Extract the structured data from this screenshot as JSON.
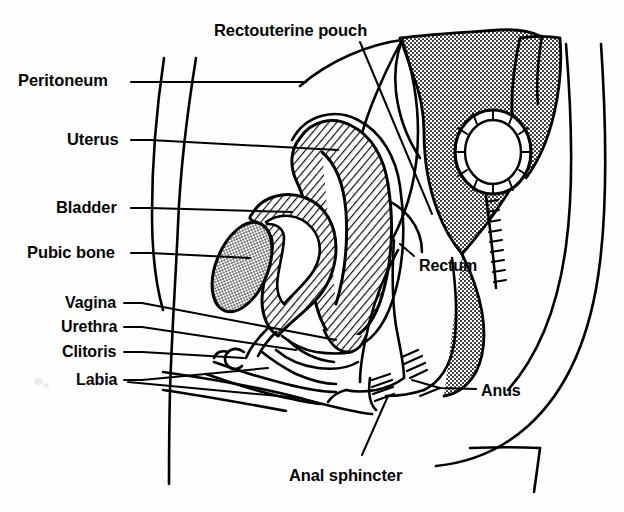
{
  "figure": {
    "title": "Rectouterine pouch",
    "kind": "anatomical-line-diagram",
    "background_color": "#fefefe",
    "ink_color": "#000000"
  },
  "labels": {
    "rectouterine_pouch": "Rectouterine pouch",
    "peritoneum": "Peritoneum",
    "uterus": "Uterus",
    "bladder": "Bladder",
    "pubic_bone": "Pubic bone",
    "vagina": "Vagina",
    "urethra": "Urethra",
    "clitoris": "Clitoris",
    "labia": "Labia",
    "rectum": "Rectum",
    "anus": "Anus",
    "anal_sphincter": "Anal sphincter"
  },
  "label_positions": {
    "rectouterine_pouch": {
      "x": 214,
      "y": 22
    },
    "peritoneum": {
      "x": 18,
      "y": 72
    },
    "uterus": {
      "x": 67,
      "y": 131
    },
    "bladder": {
      "x": 56,
      "y": 199
    },
    "pubic_bone": {
      "x": 27,
      "y": 244
    },
    "vagina": {
      "x": 65,
      "y": 295
    },
    "urethra": {
      "x": 61,
      "y": 319
    },
    "clitoris": {
      "x": 62,
      "y": 344
    },
    "labia": {
      "x": 76,
      "y": 372
    },
    "rectum": {
      "x": 419,
      "y": 258
    },
    "anus": {
      "x": 481,
      "y": 383
    },
    "anal_sphincter": {
      "x": 289,
      "y": 467
    }
  },
  "structures": [
    {
      "name": "peritoneum",
      "fill": "none",
      "description": "thin membrane line draped over uterus and pelvic organs"
    },
    {
      "name": "uterus",
      "fill": "diagonal-hatch",
      "description": "anteverted pear-shaped organ with endometrial cavity"
    },
    {
      "name": "bladder",
      "fill": "diagonal-hatch",
      "description": "hollow muscular organ anterior to uterus"
    },
    {
      "name": "pubic_bone",
      "fill": "stipple-dots",
      "description": "oval bone cross-section at front of pelvis"
    },
    {
      "name": "sacrum",
      "fill": "stipple-dots",
      "description": "wedge-shaped bone posterior to rectum"
    },
    {
      "name": "coccyx",
      "fill": "stipple-dots",
      "description": "small tailbone segments"
    },
    {
      "name": "rectum",
      "fill": "none",
      "description": "terminal bowel segment curving to anus"
    },
    {
      "name": "cervix_os",
      "fill": "none",
      "description": "small ringed circle between uterus and rectum"
    },
    {
      "name": "anal_sphincter",
      "fill": "short-hatch",
      "description": "muscular ring at anal opening"
    },
    {
      "name": "vagina",
      "fill": "none",
      "description": "canal running from cervix to vestibule"
    },
    {
      "name": "urethra",
      "fill": "none",
      "description": "short tube from bladder neck to vestibule"
    },
    {
      "name": "clitoris",
      "fill": "none",
      "description": "small hooked structure anterior to urethra"
    },
    {
      "name": "labia",
      "fill": "none",
      "description": "paired folds at vulval opening"
    },
    {
      "name": "body_outline",
      "fill": "none",
      "description": "abdominal wall and buttock silhouette"
    }
  ],
  "fill_patterns": {
    "diagonal_hatch": "#1a1a1a",
    "stipple_dots": "#7a7a7a",
    "background": "#ffffff"
  }
}
